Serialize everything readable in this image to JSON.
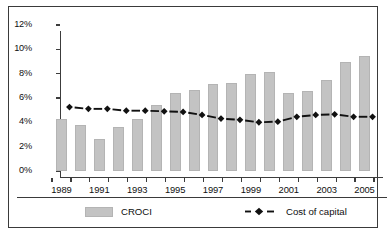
{
  "chart_data": {
    "type": "bar",
    "title": "",
    "subtitle": "",
    "xlabel": "",
    "ylabel": "",
    "categories": [
      1989,
      1990,
      1991,
      1992,
      1993,
      1994,
      1995,
      1996,
      1997,
      1998,
      1999,
      2000,
      2001,
      2002,
      2003,
      2004,
      2005
    ],
    "x_tick_labels": [
      "1989",
      "",
      "1991",
      "",
      "1993",
      "",
      "1995",
      "",
      "1997",
      "",
      "1999",
      "",
      "2001",
      "",
      "2003",
      "",
      "2005"
    ],
    "y_tick_labels": [
      "0%",
      "2%",
      "4%",
      "6%",
      "8%",
      "10%",
      "12%"
    ],
    "y_tick_values": [
      0,
      2,
      4,
      6,
      8,
      10,
      12
    ],
    "ylim": [
      0,
      12
    ],
    "grid": false,
    "legend_position": "bottom",
    "series": [
      {
        "name": "CROCI",
        "kind": "bar",
        "color": "#c3c3c3",
        "values": [
          4.25,
          3.75,
          2.6,
          3.6,
          4.3,
          5.45,
          6.4,
          6.65,
          7.15,
          7.25,
          7.95,
          8.15,
          6.45,
          6.55,
          7.5,
          9.0,
          9.45
        ]
      },
      {
        "name": "Cost of capital",
        "kind": "line",
        "color": "#111111",
        "style": "dashed-diamond",
        "values": [
          5.75,
          5.6,
          5.6,
          5.45,
          5.45,
          5.4,
          5.35,
          5.1,
          4.8,
          4.7,
          4.5,
          4.55,
          4.95,
          5.1,
          5.15,
          4.95,
          4.95
        ]
      }
    ]
  },
  "legend": {
    "items": [
      {
        "label": "CROCI",
        "key": "bar-swatch"
      },
      {
        "label": "Cost of capital",
        "key": "dashed-diamond-key"
      }
    ]
  }
}
